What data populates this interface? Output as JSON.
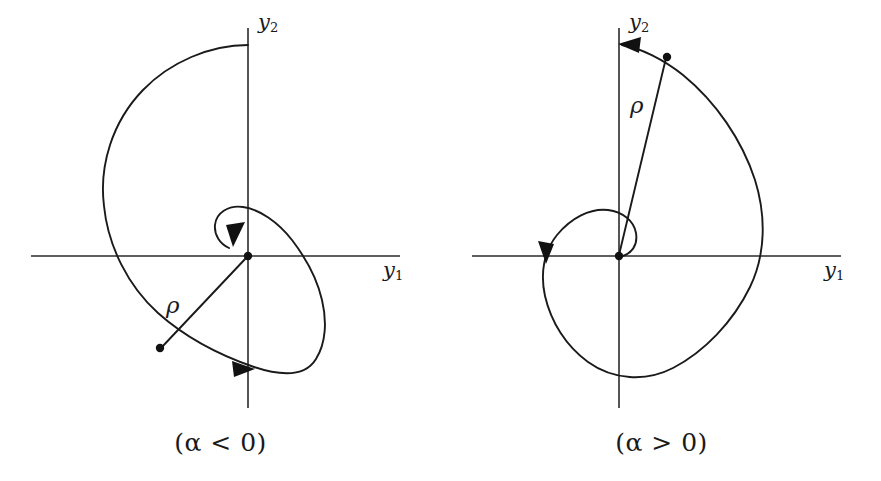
{
  "figure": {
    "background_color": "#ffffff",
    "ink_color": "#1a1a1a",
    "width": 881,
    "height": 481
  },
  "panels": [
    {
      "id": "alpha-negative",
      "caption": "(α < 0)",
      "caption_symbol": "α",
      "caption_relation": "<",
      "caption_value": "0",
      "axis_x_label": "y",
      "axis_x_sub": "1",
      "axis_y_label": "y",
      "axis_y_sub": "2",
      "radius_label": "ρ",
      "origin": {
        "x": 248,
        "y": 256
      },
      "axis_x_extent": [
        31,
        400
      ],
      "axis_y_extent": [
        28,
        408
      ],
      "spiral": {
        "type": "logarithmic",
        "direction": "inward-clockwise",
        "decay_sign": "negative",
        "theta_start_deg": 140,
        "theta_end_deg": -430,
        "r_start": 232,
        "r_end": 3,
        "leftmost_x_axis_crossing": 104,
        "rightmost_x_axis_crossing": 322,
        "top_y_axis_crossing": 45,
        "bottom_y_axis_crossing": 369
      },
      "point_marker": {
        "x": 160,
        "y": 348
      },
      "arrow_heads": [
        {
          "name": "inward-arrow",
          "x": 236,
          "y": 232,
          "angle_deg": 118
        },
        {
          "name": "crossing-arrow",
          "x": 249,
          "y": 369,
          "angle_deg": 3
        }
      ]
    },
    {
      "id": "alpha-positive",
      "caption": "(α > 0)",
      "caption_symbol": "α",
      "caption_relation": ">",
      "caption_value": "0",
      "axis_x_label": "y",
      "axis_x_sub": "1",
      "axis_y_label": "y",
      "axis_y_sub": "2",
      "radius_label": "ρ",
      "origin": {
        "x": 619,
        "y": 256
      },
      "axis_x_extent": [
        472,
        841
      ],
      "axis_y_extent": [
        28,
        408
      ],
      "spiral": {
        "type": "logarithmic",
        "direction": "outward-counterclockwise",
        "decay_sign": "positive",
        "theta_start_deg": -60,
        "theta_end_deg": 460,
        "r_start": 3,
        "r_end": 215,
        "leftmost_x_axis_crossing": 546,
        "rightmost_x_axis_crossing": 765,
        "top_y_axis_crossing": 44,
        "bottom_y_axis_crossing": 370
      },
      "point_marker": {
        "x": 667,
        "y": 57
      },
      "arrow_heads": [
        {
          "name": "outward-arrow",
          "x": 620,
          "y": 44,
          "angle_deg": 188
        },
        {
          "name": "crossing-arrow",
          "x": 547,
          "y": 253,
          "angle_deg": 105
        }
      ]
    }
  ]
}
